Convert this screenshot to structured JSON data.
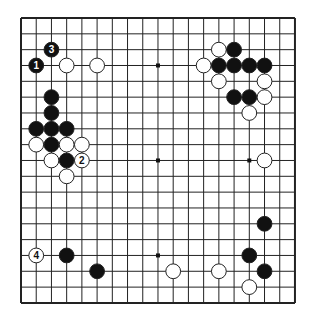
{
  "board": {
    "size": 19,
    "origin_x": 21,
    "origin_y": 18,
    "step_x": 15.22,
    "step_y": 15.83,
    "stone_radius": 7.4,
    "line_color": "#222222",
    "border_width": 2,
    "background": "#ffffff",
    "star_points": [
      [
        3,
        3
      ],
      [
        9,
        3
      ],
      [
        15,
        3
      ],
      [
        3,
        9
      ],
      [
        9,
        9
      ],
      [
        15,
        9
      ],
      [
        3,
        15
      ],
      [
        9,
        15
      ],
      [
        15,
        15
      ]
    ]
  },
  "stones": [
    {
      "color": "black",
      "x": 1,
      "y": 3,
      "label": "1"
    },
    {
      "color": "black",
      "x": 2,
      "y": 2,
      "label": "3"
    },
    {
      "color": "white",
      "x": 4,
      "y": 9,
      "label": "2"
    },
    {
      "color": "white",
      "x": 1,
      "y": 15,
      "label": "4"
    },
    {
      "color": "white",
      "x": 3,
      "y": 3,
      "label": ""
    },
    {
      "color": "white",
      "x": 5,
      "y": 3,
      "label": ""
    },
    {
      "color": "white",
      "x": 13,
      "y": 2,
      "label": ""
    },
    {
      "color": "black",
      "x": 14,
      "y": 2,
      "label": ""
    },
    {
      "color": "white",
      "x": 12,
      "y": 3,
      "label": ""
    },
    {
      "color": "black",
      "x": 13,
      "y": 3,
      "label": ""
    },
    {
      "color": "black",
      "x": 14,
      "y": 3,
      "label": ""
    },
    {
      "color": "black",
      "x": 15,
      "y": 3,
      "label": ""
    },
    {
      "color": "black",
      "x": 16,
      "y": 3,
      "label": ""
    },
    {
      "color": "white",
      "x": 13,
      "y": 4,
      "label": ""
    },
    {
      "color": "white",
      "x": 16,
      "y": 4,
      "label": ""
    },
    {
      "color": "black",
      "x": 14,
      "y": 5,
      "label": ""
    },
    {
      "color": "black",
      "x": 15,
      "y": 5,
      "label": ""
    },
    {
      "color": "white",
      "x": 16,
      "y": 5,
      "label": ""
    },
    {
      "color": "white",
      "x": 15,
      "y": 6,
      "label": ""
    },
    {
      "color": "black",
      "x": 2,
      "y": 5,
      "label": ""
    },
    {
      "color": "black",
      "x": 2,
      "y": 6,
      "label": ""
    },
    {
      "color": "black",
      "x": 1,
      "y": 7,
      "label": ""
    },
    {
      "color": "black",
      "x": 2,
      "y": 7,
      "label": ""
    },
    {
      "color": "black",
      "x": 3,
      "y": 7,
      "label": ""
    },
    {
      "color": "white",
      "x": 1,
      "y": 8,
      "label": ""
    },
    {
      "color": "black",
      "x": 2,
      "y": 8,
      "label": ""
    },
    {
      "color": "white",
      "x": 3,
      "y": 8,
      "label": ""
    },
    {
      "color": "white",
      "x": 4,
      "y": 8,
      "label": ""
    },
    {
      "color": "white",
      "x": 2,
      "y": 9,
      "label": ""
    },
    {
      "color": "black",
      "x": 3,
      "y": 9,
      "label": ""
    },
    {
      "color": "white",
      "x": 3,
      "y": 10,
      "label": ""
    },
    {
      "color": "white",
      "x": 16,
      "y": 9,
      "label": ""
    },
    {
      "color": "black",
      "x": 3,
      "y": 15,
      "label": ""
    },
    {
      "color": "black",
      "x": 5,
      "y": 16,
      "label": ""
    },
    {
      "color": "black",
      "x": 16,
      "y": 13,
      "label": ""
    },
    {
      "color": "black",
      "x": 15,
      "y": 15,
      "label": ""
    },
    {
      "color": "black",
      "x": 16,
      "y": 16,
      "label": ""
    },
    {
      "color": "white",
      "x": 10,
      "y": 16,
      "label": ""
    },
    {
      "color": "white",
      "x": 13,
      "y": 16,
      "label": ""
    },
    {
      "color": "white",
      "x": 15,
      "y": 17,
      "label": ""
    }
  ]
}
